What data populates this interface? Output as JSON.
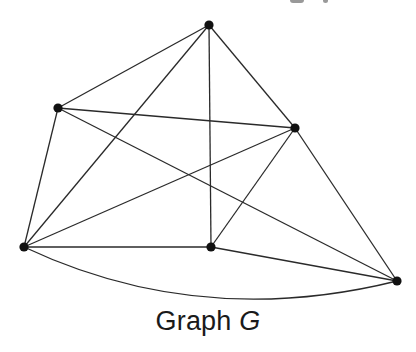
{
  "figure": {
    "caption_prefix": "Graph ",
    "caption_variable": "G",
    "edge_color": "#2a2a2a",
    "vertex_color": "#111111"
  },
  "graph": {
    "name": "G",
    "vertices": [
      {
        "id": "T",
        "x": 209,
        "y": 25
      },
      {
        "id": "UL",
        "x": 58,
        "y": 108
      },
      {
        "id": "R",
        "x": 295,
        "y": 128
      },
      {
        "id": "BL",
        "x": 24,
        "y": 247
      },
      {
        "id": "MB",
        "x": 211,
        "y": 247
      },
      {
        "id": "BR",
        "x": 397,
        "y": 281
      }
    ],
    "edges": [
      {
        "from": "T",
        "to": "UL"
      },
      {
        "from": "T",
        "to": "BL"
      },
      {
        "from": "T",
        "to": "MB"
      },
      {
        "from": "T",
        "to": "R"
      },
      {
        "from": "UL",
        "to": "R"
      },
      {
        "from": "UL",
        "to": "BL"
      },
      {
        "from": "UL",
        "to": "BR"
      },
      {
        "from": "R",
        "to": "BL"
      },
      {
        "from": "R",
        "to": "MB"
      },
      {
        "from": "R",
        "to": "BR"
      },
      {
        "from": "BL",
        "to": "MB"
      },
      {
        "from": "MB",
        "to": "BR"
      },
      {
        "from": "BL",
        "to": "BR",
        "curved": true,
        "control": {
          "x": 200,
          "y": 330
        }
      }
    ],
    "vertex_count": 6,
    "edge_count": 13
  }
}
